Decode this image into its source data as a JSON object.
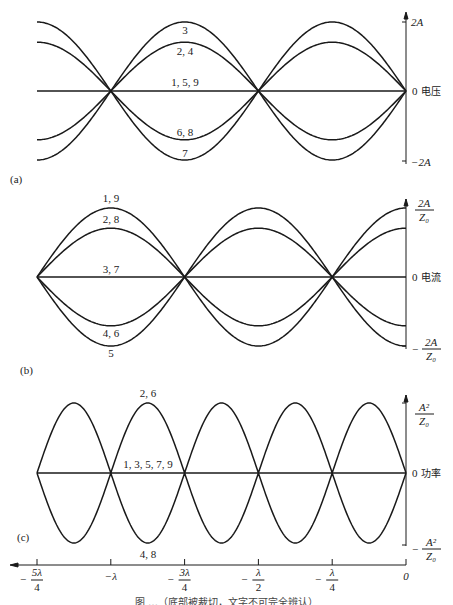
{
  "figure": {
    "panels": [
      {
        "id": "a",
        "label": "(a)",
        "axis_title": "电压",
        "ticks": {
          "top": "2A",
          "zero": "0",
          "bottom": "−2A"
        },
        "curve_labels": [
          "3",
          "2, 4",
          "1, 5, 9",
          "6, 8",
          "7"
        ]
      },
      {
        "id": "b",
        "label": "(b)",
        "axis_title": "电流",
        "ticks": {
          "top_num": "2A",
          "top_den": "Z₀",
          "zero": "0",
          "bottom_sign": "−",
          "bottom_num": "2A",
          "bottom_den": "Z₀"
        },
        "curve_labels": [
          "1, 9",
          "2, 8",
          "3, 7",
          "4, 6",
          "5"
        ]
      },
      {
        "id": "c",
        "label": "(c)",
        "axis_title": "功率",
        "ticks": {
          "top_num": "A²",
          "top_den": "Z₀",
          "zero": "0",
          "bottom_sign": "−",
          "bottom_num": "A²",
          "bottom_den": "Z₀"
        },
        "curve_labels": [
          "2, 6",
          "1, 3, 5, 7, 9",
          "4, 8"
        ]
      }
    ],
    "x_axis": {
      "ticks": [
        {
          "sign": "−",
          "num": "5λ",
          "den": "4"
        },
        {
          "sign": "",
          "num": "−λ",
          "den": ""
        },
        {
          "sign": "−",
          "num": "3λ",
          "den": "4"
        },
        {
          "sign": "−",
          "num": "λ",
          "den": "2"
        },
        {
          "sign": "−",
          "num": "λ",
          "den": "4"
        },
        {
          "sign": "",
          "num": "0",
          "den": ""
        }
      ]
    },
    "caption_visible": "图 …（底部被裁切，文字不可完全辨认）"
  },
  "chart_data": [
    {
      "type": "line",
      "title": "(a) 电压",
      "xlabel": "z (position from load)",
      "ylabel": "电压",
      "x": [
        "-5λ/4",
        "-λ",
        "-3λ/4",
        "-λ/2",
        "-λ/4",
        "0"
      ],
      "ylim": [
        "-2A",
        "2A"
      ],
      "grid": false,
      "series": [
        {
          "name": "3",
          "amplitude_frac": 1.0,
          "sign": 1
        },
        {
          "name": "2, 4",
          "amplitude_frac": 0.707,
          "sign": 1
        },
        {
          "name": "1, 5, 9",
          "amplitude_frac": 0.0,
          "sign": 1
        },
        {
          "name": "6, 8",
          "amplitude_frac": 0.707,
          "sign": -1
        },
        {
          "name": "7",
          "amplitude_frac": 1.0,
          "sign": -1
        }
      ],
      "shape": "|sin(2πz/λ)| style, nodes at z = -λ, -λ/2, 0; peaks at -3λ/4, -λ/4"
    },
    {
      "type": "line",
      "title": "(b) 电流",
      "xlabel": "z (position from load)",
      "ylabel": "电流",
      "x": [
        "-5λ/4",
        "-λ",
        "-3λ/4",
        "-λ/2",
        "-λ/4",
        "0"
      ],
      "ylim": [
        "-2A/Z0",
        "2A/Z0"
      ],
      "grid": false,
      "series": [
        {
          "name": "1, 9",
          "amplitude_frac": 1.0,
          "sign": 1
        },
        {
          "name": "2, 8",
          "amplitude_frac": 0.707,
          "sign": 1
        },
        {
          "name": "3, 7",
          "amplitude_frac": 0.0,
          "sign": 1
        },
        {
          "name": "4, 6",
          "amplitude_frac": 0.707,
          "sign": -1
        },
        {
          "name": "5",
          "amplitude_frac": 1.0,
          "sign": -1
        }
      ],
      "shape": "cos(2πz/λ) style, nodes at z = -5λ/4, -3λ/4, -λ/4; peaks at -λ, -λ/2, 0"
    },
    {
      "type": "line",
      "title": "(c) 功率",
      "xlabel": "z (position from load)",
      "ylabel": "功率",
      "x": [
        "-5λ/4",
        "-λ",
        "-3λ/4",
        "-λ/2",
        "-λ/4",
        "0"
      ],
      "ylim": [
        "-A²/Z0",
        "A²/Z0"
      ],
      "grid": false,
      "series": [
        {
          "name": "2, 6",
          "amplitude_frac": 1.0,
          "sign": 1
        },
        {
          "name": "1, 3, 5, 7, 9",
          "amplitude_frac": 0.0,
          "sign": 1
        },
        {
          "name": "4, 8",
          "amplitude_frac": 1.0,
          "sign": -1
        }
      ],
      "shape": "|sin(4πz/λ)| style, nodes every λ/4 from -5λ/4 to 0"
    }
  ]
}
